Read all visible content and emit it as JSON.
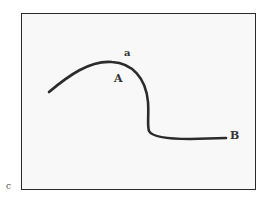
{
  "figure": {
    "labels": {
      "a": "a",
      "A": "A",
      "B": "B",
      "c": "c"
    },
    "colors": {
      "curve": "#2b2b2b",
      "frame_border": "#2a2a2a",
      "frame_fill": "#f8f8f8"
    },
    "curve_description": "Smooth stroke rising from left to a rounded peak near label A, dropping nearly vertically, then bending right into a flat tail ending at point B"
  }
}
